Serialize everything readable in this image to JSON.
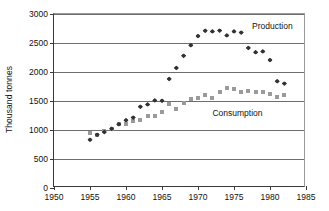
{
  "chart_data": {
    "type": "scatter",
    "title": "",
    "xlabel": "",
    "ylabel": "Thousand tonnes",
    "xlim": [
      1950,
      1985
    ],
    "ylim": [
      0,
      3000
    ],
    "xticks": [
      1950,
      1955,
      1960,
      1965,
      1970,
      1975,
      1980,
      1985
    ],
    "yticks": [
      0,
      500,
      1000,
      1500,
      2000,
      2500,
      3000
    ],
    "grid": "horizontal",
    "legend_position": "inline-annotation",
    "annotations": [
      {
        "text": "Production",
        "x": 1977.5,
        "y": 2780
      },
      {
        "text": "Consumption",
        "x": 1972.0,
        "y": 1280
      }
    ],
    "series": [
      {
        "name": "Production",
        "marker": "diamond",
        "color": "#333333",
        "x": [
          1955,
          1956,
          1957,
          1958,
          1959,
          1960,
          1961,
          1962,
          1963,
          1964,
          1965,
          1966,
          1967,
          1968,
          1969,
          1970,
          1971,
          1972,
          1973,
          1974,
          1975,
          1976,
          1977,
          1978,
          1979,
          1980,
          1981,
          1982
        ],
        "y": [
          830,
          920,
          965,
          1020,
          1100,
          1170,
          1215,
          1400,
          1440,
          1510,
          1505,
          1880,
          2070,
          2280,
          2460,
          2620,
          2710,
          2700,
          2715,
          2630,
          2700,
          2680,
          2415,
          2340,
          2355,
          2205,
          1840,
          1800
        ]
      },
      {
        "name": "Consumption",
        "marker": "square",
        "color": "#9a9a9a",
        "x": [
          1955,
          1956,
          1957,
          1958,
          1959,
          1960,
          1961,
          1962,
          1963,
          1964,
          1965,
          1966,
          1967,
          1968,
          1969,
          1970,
          1971,
          1972,
          1973,
          1974,
          1975,
          1976,
          1977,
          1978,
          1979,
          1980,
          1981,
          1982
        ],
        "y": [
          955,
          915,
          985,
          1010,
          1105,
          1110,
          1160,
          1175,
          1245,
          1235,
          1305,
          1450,
          1370,
          1470,
          1530,
          1545,
          1605,
          1550,
          1660,
          1720,
          1715,
          1650,
          1665,
          1660,
          1650,
          1620,
          1565,
          1610
        ]
      }
    ]
  },
  "axis": {
    "y_title": "Thousand tonnes",
    "y_tick_labels": [
      "3000",
      "2500",
      "2000",
      "1500",
      "1000",
      "500",
      "0"
    ],
    "x_tick_labels": [
      "1950",
      "1955",
      "1960",
      "1965",
      "1970",
      "1975",
      "1980",
      "1985"
    ]
  },
  "labels": {
    "production": "Production",
    "consumption": "Consumption"
  }
}
